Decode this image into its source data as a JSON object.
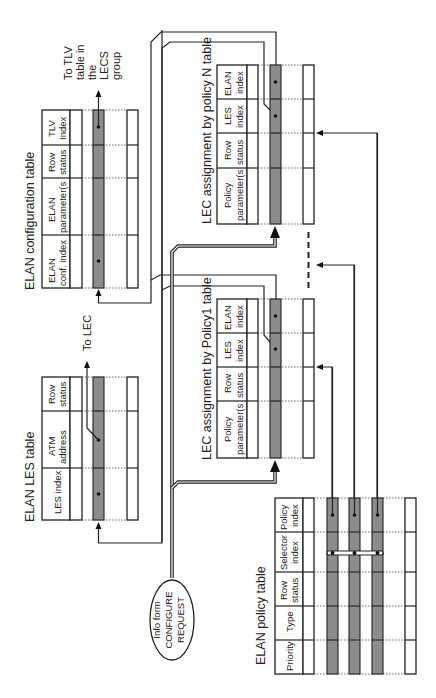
{
  "diagram": {
    "elan_config_table": {
      "title": "ELAN configuration table",
      "columns": [
        "ELAN conf. index",
        "ELAN parameter(s",
        "Row status",
        "TLV Index"
      ],
      "col_lines": [
        [
          "ELAN",
          "conf. index"
        ],
        [
          "ELAN",
          "parameter(s"
        ],
        [
          "Row",
          "status"
        ],
        [
          "TLV",
          "Index"
        ]
      ],
      "arrow_out_label": [
        "To TLV",
        "table in",
        "the",
        "LECS",
        "group"
      ]
    },
    "elan_les_table": {
      "title": "ELAN LES table",
      "columns": [
        "LES index",
        "ATM address",
        "Row status"
      ],
      "col_lines": [
        [
          "LES index"
        ],
        [
          "ATM",
          "address"
        ],
        [
          "Row",
          "status"
        ]
      ],
      "arrow_out_label": "To LEC"
    },
    "lec_policy_n_table": {
      "title": "LEC assignment by policy N table",
      "columns": [
        "Policy parameter(s",
        "Row status",
        "LES index",
        "ELAN index"
      ],
      "col_lines": [
        [
          "Policy",
          "parameter(s"
        ],
        [
          "Row",
          "status"
        ],
        [
          "LES",
          "index"
        ],
        [
          "ELAN",
          "index"
        ]
      ]
    },
    "lec_policy_1_table": {
      "title": "LEC assignment by Policy1 table",
      "columns": [
        "Policy parameter(s",
        "Row status",
        "LES index",
        "ELAN index"
      ],
      "col_lines": [
        [
          "Policy",
          "parameter(s"
        ],
        [
          "Row",
          "status"
        ],
        [
          "LES",
          "index"
        ],
        [
          "ELAN",
          "index"
        ]
      ]
    },
    "elan_policy_table": {
      "title": "ELAN policy table",
      "columns": [
        "Priority",
        "Type",
        "Row status",
        "Selector index",
        "Policy index"
      ],
      "col_lines": [
        [
          "Priority"
        ],
        [
          "Type"
        ],
        [
          "Row",
          "status"
        ],
        [
          "Selector",
          "index"
        ],
        [
          "Policy",
          "index"
        ]
      ]
    },
    "info_form": {
      "lines": [
        "Info form",
        "CONFIGURE",
        "REQUEST"
      ]
    },
    "colors": {
      "highlight_row": "#8c8c8c",
      "line": "#222222",
      "background": "#ffffff"
    }
  }
}
